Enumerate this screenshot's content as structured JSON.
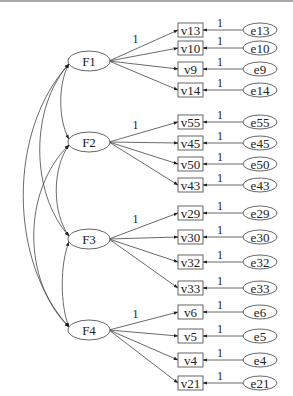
{
  "diagram": {
    "type": "structural-equation-model",
    "factors": [
      {
        "name": "F1",
        "indicators": [
          "v13",
          "v10",
          "v9",
          "v14"
        ],
        "errors": [
          "e13",
          "e10",
          "e9",
          "e14"
        ]
      },
      {
        "name": "F2",
        "indicators": [
          "v55",
          "v45",
          "v50",
          "v43"
        ],
        "errors": [
          "e55",
          "e45",
          "e50",
          "e43"
        ]
      },
      {
        "name": "F3",
        "indicators": [
          "v29",
          "v30",
          "v32",
          "v33"
        ],
        "errors": [
          "e29",
          "e30",
          "e32",
          "e33"
        ]
      },
      {
        "name": "F4",
        "indicators": [
          "v6",
          "v5",
          "v4",
          "v21"
        ],
        "errors": [
          "e6",
          "e5",
          "e4",
          "e21"
        ]
      }
    ],
    "fixed_loading_label": "1",
    "error_path_label": "1",
    "covariances": [
      [
        "F1",
        "F2"
      ],
      [
        "F1",
        "F3"
      ],
      [
        "F1",
        "F4"
      ],
      [
        "F2",
        "F3"
      ],
      [
        "F2",
        "F4"
      ],
      [
        "F3",
        "F4"
      ]
    ]
  }
}
